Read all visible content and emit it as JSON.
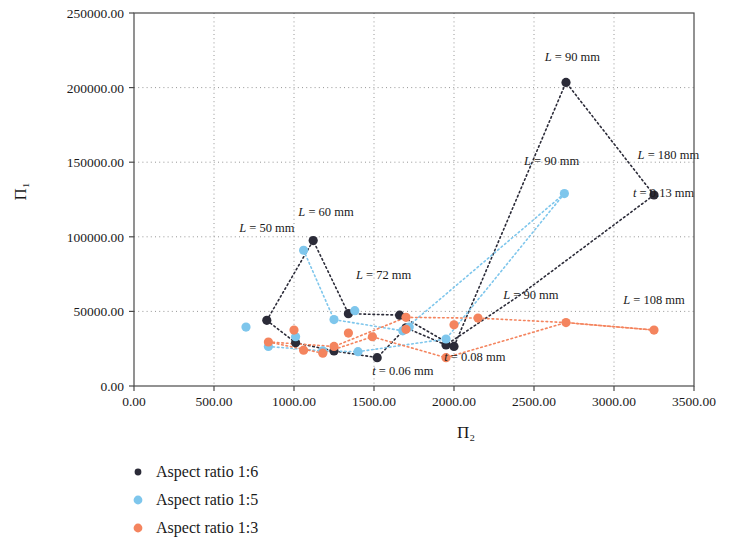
{
  "chart_data": {
    "type": "scatter",
    "title": "",
    "xlabel": "Π₂",
    "ylabel": "Π₁",
    "xlim": [
      0,
      3500
    ],
    "ylim": [
      0,
      250000
    ],
    "xticks": [
      "0.00",
      "500.00",
      "1000.00",
      "1500.00",
      "2000.00",
      "2500.00",
      "3000.00",
      "3500.00"
    ],
    "xtick_values": [
      0,
      500,
      1000,
      1500,
      2000,
      2500,
      3000,
      3500
    ],
    "yticks": [
      "0.00",
      "50000.00",
      "100000.00",
      "150000.00",
      "200000.00",
      "250000.00"
    ],
    "ytick_values": [
      0,
      50000,
      100000,
      150000,
      200000,
      250000
    ],
    "grid": true,
    "legend_position": "below-left",
    "series": [
      {
        "name": "Aspect ratio 1:6",
        "color": "#2b2b38",
        "marker": "circle",
        "connected": true,
        "points": [
          [
            830,
            44000
          ],
          [
            1010,
            29000
          ],
          [
            1120,
            97500
          ],
          [
            1250,
            23500
          ],
          [
            1340,
            48500
          ],
          [
            1520,
            19000
          ],
          [
            1660,
            47500
          ],
          [
            1700,
            39000
          ],
          [
            1950,
            27500
          ],
          [
            2000,
            26500
          ],
          [
            2700,
            203500
          ],
          [
            3250,
            128000
          ]
        ],
        "lines": [
          [
            [
              830,
              44000
            ],
            [
              1120,
              97500
            ],
            [
              1340,
              48500
            ],
            [
              1660,
              47500
            ],
            [
              2000,
              26500
            ],
            [
              2700,
              203500
            ],
            [
              3250,
              128000
            ]
          ],
          [
            [
              830,
              44000
            ],
            [
              1010,
              29000
            ],
            [
              1250,
              23500
            ],
            [
              1520,
              19000
            ],
            [
              1700,
              39000
            ],
            [
              1950,
              27500
            ],
            [
              2400,
              60000
            ],
            [
              3250,
              128000
            ]
          ]
        ]
      },
      {
        "name": "Aspect ratio 1:5",
        "color": "#7ec6ec",
        "marker": "circle",
        "connected": true,
        "points": [
          [
            700,
            39500
          ],
          [
            840,
            26500
          ],
          [
            1010,
            33000
          ],
          [
            1060,
            91000
          ],
          [
            1180,
            23500
          ],
          [
            1250,
            44500
          ],
          [
            1380,
            50500
          ],
          [
            1400,
            23000
          ],
          [
            1680,
            37000
          ],
          [
            1720,
            39500
          ],
          [
            1950,
            31500
          ],
          [
            2690,
            129000
          ]
        ],
        "lines": [
          [
            [
              1060,
              91000
            ],
            [
              1250,
              44500
            ],
            [
              1680,
              37000
            ],
            [
              2690,
              129000
            ]
          ],
          [
            [
              840,
              26500
            ],
            [
              1180,
              23500
            ],
            [
              1400,
              23000
            ],
            [
              1950,
              31500
            ],
            [
              2690,
              129000
            ]
          ]
        ]
      },
      {
        "name": "Aspect ratio 1:3",
        "color": "#f4845e",
        "marker": "circle",
        "connected": true,
        "points": [
          [
            840,
            29500
          ],
          [
            1000,
            37500
          ],
          [
            1060,
            24000
          ],
          [
            1180,
            22000
          ],
          [
            1250,
            26500
          ],
          [
            1340,
            35500
          ],
          [
            1490,
            33000
          ],
          [
            1700,
            38000
          ],
          [
            1700,
            46000
          ],
          [
            1950,
            19000
          ],
          [
            2000,
            41000
          ],
          [
            2150,
            45500
          ],
          [
            2700,
            42500
          ],
          [
            3250,
            37500
          ]
        ],
        "lines": [
          [
            [
              840,
              29500
            ],
            [
              1250,
              26500
            ],
            [
              1700,
              46000
            ],
            [
              2150,
              45500
            ],
            [
              2700,
              42500
            ],
            [
              3250,
              37500
            ]
          ],
          [
            [
              840,
              29500
            ],
            [
              1180,
              22000
            ],
            [
              1490,
              33000
            ],
            [
              1950,
              19000
            ],
            [
              2700,
              42500
            ],
            [
              3250,
              37500
            ]
          ]
        ]
      }
    ],
    "annotations": [
      {
        "id": "ann-L50",
        "text_parts": {
          "var": "L",
          "rest": " = 50 mm"
        },
        "x": 830,
        "y": 103000,
        "anchor": "middle"
      },
      {
        "id": "ann-L60",
        "text_parts": {
          "var": "L",
          "rest": " = 60 mm"
        },
        "x": 1200,
        "y": 114000,
        "anchor": "middle"
      },
      {
        "id": "ann-L72",
        "text_parts": {
          "var": "L",
          "rest": " = 72 mm"
        },
        "x": 1560,
        "y": 72000,
        "anchor": "middle"
      },
      {
        "id": "ann-L90a",
        "text_parts": {
          "var": "L",
          "rest": " = 90 mm"
        },
        "x": 2740,
        "y": 218000,
        "anchor": "middle"
      },
      {
        "id": "ann-L90b",
        "text_parts": {
          "var": "L",
          "rest": " = 90 mm"
        },
        "x": 2610,
        "y": 148000,
        "anchor": "middle"
      },
      {
        "id": "ann-L90c",
        "text_parts": {
          "var": "L",
          "rest": " = 90 mm"
        },
        "x": 2480,
        "y": 58000,
        "anchor": "middle"
      },
      {
        "id": "ann-L180",
        "text_parts": {
          "var": "L",
          "rest": " = 180 mm"
        },
        "x": 3340,
        "y": 152000,
        "anchor": "middle"
      },
      {
        "id": "ann-L108",
        "text_parts": {
          "var": "L",
          "rest": " = 108 mm"
        },
        "x": 3250,
        "y": 55000,
        "anchor": "middle"
      },
      {
        "id": "ann-t013",
        "text_parts": {
          "var": "t",
          "rest": " = 0.13 mm"
        },
        "x": 3310,
        "y": 127000,
        "anchor": "middle"
      },
      {
        "id": "ann-t008",
        "text_parts": {
          "var": "t",
          "rest": " = 0.08 mm"
        },
        "x": 2130,
        "y": 16500,
        "anchor": "middle"
      },
      {
        "id": "ann-t006",
        "text_parts": {
          "var": "t",
          "rest": " = 0.06 mm"
        },
        "x": 1680,
        "y": 7500,
        "anchor": "middle"
      }
    ],
    "legend": [
      {
        "label": "Aspect ratio 1:6",
        "color": "#2b2b38"
      },
      {
        "label": "Aspect ratio 1:5",
        "color": "#7ec6ec"
      },
      {
        "label": "Aspect ratio 1:3",
        "color": "#f4845e"
      }
    ]
  }
}
